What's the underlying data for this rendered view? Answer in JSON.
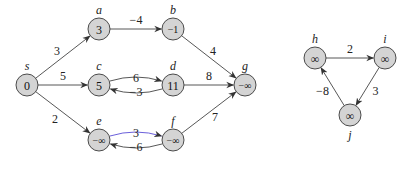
{
  "graphs": [
    {
      "name": "left-graph",
      "nodes": [
        {
          "id": "s",
          "label": "s",
          "value": "0"
        },
        {
          "id": "a",
          "label": "a",
          "value": "3"
        },
        {
          "id": "b",
          "label": "b",
          "value": "−1"
        },
        {
          "id": "c",
          "label": "c",
          "value": "5"
        },
        {
          "id": "d",
          "label": "d",
          "value": "11"
        },
        {
          "id": "e",
          "label": "e",
          "value": "−∞"
        },
        {
          "id": "f",
          "label": "f",
          "value": "−∞"
        },
        {
          "id": "g",
          "label": "g",
          "value": "−∞"
        }
      ],
      "edges": [
        {
          "from": "s",
          "to": "a",
          "weight": "3"
        },
        {
          "from": "s",
          "to": "c",
          "weight": "5"
        },
        {
          "from": "s",
          "to": "e",
          "weight": "2"
        },
        {
          "from": "a",
          "to": "b",
          "weight": "−4"
        },
        {
          "from": "b",
          "to": "g",
          "weight": "4"
        },
        {
          "from": "c",
          "to": "d",
          "weight": "6"
        },
        {
          "from": "d",
          "to": "c",
          "weight": "−3"
        },
        {
          "from": "d",
          "to": "g",
          "weight": "8"
        },
        {
          "from": "e",
          "to": "f",
          "weight": "3"
        },
        {
          "from": "f",
          "to": "e",
          "weight": "−6"
        },
        {
          "from": "f",
          "to": "g",
          "weight": "7"
        }
      ]
    },
    {
      "name": "right-graph",
      "nodes": [
        {
          "id": "h",
          "label": "h",
          "value": "∞"
        },
        {
          "id": "i",
          "label": "i",
          "value": "∞"
        },
        {
          "id": "j",
          "label": "j",
          "value": "∞"
        }
      ],
      "edges": [
        {
          "from": "h",
          "to": "i",
          "weight": "2"
        },
        {
          "from": "i",
          "to": "j",
          "weight": "3"
        },
        {
          "from": "j",
          "to": "h",
          "weight": "−8"
        }
      ]
    }
  ],
  "colors": {
    "node_fill": "#d4d4d4",
    "edge": "#444444",
    "highlight_edge": "#5a4ed6"
  }
}
